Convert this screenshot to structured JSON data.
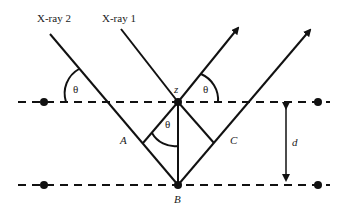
{
  "diagram": {
    "type": "bragg-diffraction",
    "labels": {
      "xray1": "X-ray 1",
      "xray2": "X-ray 2",
      "theta": "θ",
      "z": "z",
      "A": "A",
      "B": "B",
      "C": "C",
      "d": "d"
    },
    "colors": {
      "line": "#111111",
      "background": "#ffffff"
    }
  }
}
